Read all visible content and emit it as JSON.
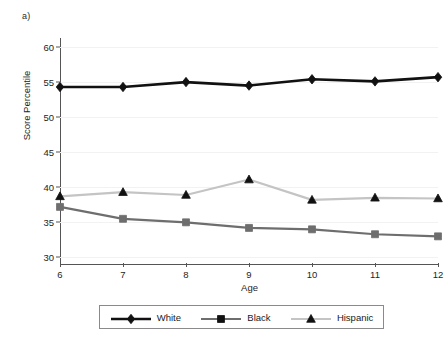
{
  "figure": {
    "panel_label": "a)"
  },
  "chart_data": {
    "type": "line",
    "title": "",
    "xlabel": "Age",
    "ylabel": "Score Percentile",
    "x": [
      6,
      7,
      8,
      9,
      10,
      11,
      12
    ],
    "xtick_labels": [
      "6",
      "7",
      "8",
      "9",
      "10",
      "11",
      "12"
    ],
    "ytick_labels": [
      "30",
      "35",
      "40",
      "45",
      "50",
      "55",
      "60"
    ],
    "yticks": [
      30,
      35,
      40,
      45,
      50,
      55,
      60
    ],
    "xlim": [
      6,
      12
    ],
    "ylim": [
      29.2,
      61.0
    ],
    "grid": true,
    "legend_position": "bottom",
    "series": [
      {
        "name": "White",
        "marker": "diamond",
        "color": "#111111",
        "line_width": 2.6,
        "values": [
          54.3,
          54.3,
          55.0,
          54.5,
          55.4,
          55.1,
          55.7
        ]
      },
      {
        "name": "Black",
        "marker": "square",
        "color": "#6e6e6e",
        "line_width": 2.2,
        "values": [
          37.2,
          35.5,
          35.0,
          34.2,
          34.0,
          33.3,
          33.0
        ]
      },
      {
        "name": "Hispanic",
        "marker": "triangle",
        "color": "#c4c4c4",
        "line_width": 2.2,
        "values": [
          38.7,
          39.3,
          38.9,
          41.1,
          38.2,
          38.5,
          38.4
        ]
      }
    ]
  },
  "legend": {
    "items": [
      {
        "label": "White"
      },
      {
        "label": "Black"
      },
      {
        "label": "Hispanic"
      }
    ]
  }
}
